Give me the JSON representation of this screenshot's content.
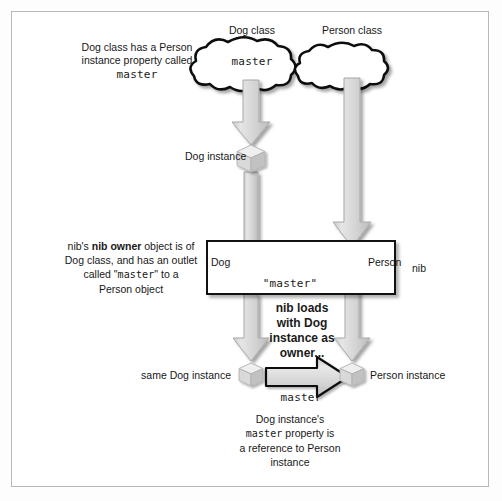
{
  "figure": {
    "title_hidden": "",
    "top_labels": {
      "dog_class": "Dog class",
      "person_class": "Person class"
    },
    "clouds": [
      {
        "name": "dog-class-cloud",
        "text": "master"
      },
      {
        "name": "person-class-cloud",
        "text": ""
      }
    ],
    "annotations": {
      "left_top": [
        "Dog class has a Person",
        "instance property called"
      ],
      "left_top_mono": "master",
      "dog_instance_label": "Dog instance",
      "left_mid_line1_a": "nib's ",
      "left_mid_line1_b": "nib owner",
      "left_mid_line1_c": " object is of",
      "left_mid_line2": "Dog class, and has an outlet",
      "left_mid_line3_a": "called \"",
      "left_mid_line3_b": "master",
      "left_mid_line3_c": "\" to a",
      "left_mid_line4": "Person object",
      "nib_label": "nib",
      "nib_loads": [
        "nib loads",
        "with Dog",
        "instance as",
        "owner..."
      ],
      "same_dog_instance": "same Dog instance",
      "person_instance": "Person instance",
      "bottom_caption": [
        "Dog instance's",
        "a reference to Person",
        "instance"
      ],
      "bottom_caption_mono": "master",
      "bottom_caption_mono_tail": " property is"
    },
    "nib_box": {
      "dog_label": "Dog",
      "person_label": "Person",
      "outlet_name": "\"master\""
    },
    "bottom_arrow_label": "master",
    "colors": {
      "arrow_fill": "#d2d2d2",
      "arrow_stroke": "#9a9a9a",
      "outline": "#111111",
      "cube_light": "#efefef",
      "cube_mid": "#d8d8d8",
      "cube_dark": "#bdbdbd",
      "frame": "#b9b9b9",
      "background": "#ffffff",
      "text": "#181818"
    }
  }
}
